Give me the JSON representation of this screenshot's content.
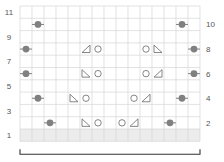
{
  "chart_data": {
    "type": "knitting-chart",
    "columns": 15,
    "rows": 11,
    "row_labels_left": [
      "1",
      "3",
      "5",
      "7",
      "9",
      "11"
    ],
    "row_labels_right": [
      "2",
      "4",
      "6",
      "8",
      "10"
    ],
    "shaded_row": 1,
    "colors": {
      "grid": "#d6d6d6",
      "shade": "#ececec",
      "symbol": "#777777",
      "bobble": "#808080",
      "label": "#555555",
      "bracket": "#333333"
    },
    "symbols": [
      {
        "row": 10,
        "col": 2,
        "type": "bobble"
      },
      {
        "row": 10,
        "col": 14,
        "type": "bobble"
      },
      {
        "row": 8,
        "col": 1,
        "type": "bobble"
      },
      {
        "row": 8,
        "col": 6,
        "type": "tri-left"
      },
      {
        "row": 8,
        "col": 7,
        "type": "yo"
      },
      {
        "row": 8,
        "col": 11,
        "type": "yo"
      },
      {
        "row": 8,
        "col": 12,
        "type": "tri-right"
      },
      {
        "row": 8,
        "col": 15,
        "type": "bobble"
      },
      {
        "row": 6,
        "col": 1,
        "type": "bobble"
      },
      {
        "row": 6,
        "col": 6,
        "type": "tri-right"
      },
      {
        "row": 6,
        "col": 7,
        "type": "yo"
      },
      {
        "row": 6,
        "col": 11,
        "type": "yo"
      },
      {
        "row": 6,
        "col": 12,
        "type": "tri-left"
      },
      {
        "row": 6,
        "col": 15,
        "type": "bobble"
      },
      {
        "row": 4,
        "col": 2,
        "type": "bobble"
      },
      {
        "row": 4,
        "col": 5,
        "type": "tri-right"
      },
      {
        "row": 4,
        "col": 6,
        "type": "yo"
      },
      {
        "row": 4,
        "col": 10,
        "type": "yo"
      },
      {
        "row": 4,
        "col": 11,
        "type": "tri-left"
      },
      {
        "row": 4,
        "col": 14,
        "type": "bobble"
      },
      {
        "row": 2,
        "col": 3,
        "type": "bobble"
      },
      {
        "row": 2,
        "col": 6,
        "type": "tri-right"
      },
      {
        "row": 2,
        "col": 7,
        "type": "yo"
      },
      {
        "row": 2,
        "col": 9,
        "type": "yo"
      },
      {
        "row": 2,
        "col": 10,
        "type": "tri-left"
      },
      {
        "row": 2,
        "col": 13,
        "type": "bobble"
      }
    ],
    "repeat_bracket": {
      "from_col": 1,
      "to_col": 15
    }
  }
}
